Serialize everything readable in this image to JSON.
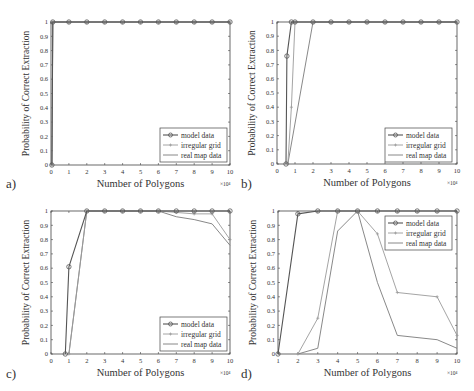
{
  "figure": {
    "y_label": "Probability of Correct Extraction",
    "x_label": "Number of Polygons",
    "x_exponent": "×10⁴",
    "legend": [
      "model data",
      "irregular grid",
      "real map data"
    ]
  },
  "colors": {
    "model": "#555555",
    "irregular": "#9a9a9a",
    "real": "#7a7a7a",
    "axis": "#444444"
  },
  "chart_data": [
    {
      "panel": "a)",
      "type": "line",
      "xlabel": "Number of Polygons",
      "ylabel": "Probability of Correct Extraction",
      "x_multiplier": "x10^4",
      "xlim": [
        0,
        10
      ],
      "ylim": [
        0,
        1
      ],
      "xticks": [
        0,
        1,
        2,
        3,
        4,
        5,
        6,
        7,
        8,
        9,
        10
      ],
      "yticks": [
        0,
        0.1,
        0.2,
        0.3,
        0.4,
        0.5,
        0.6,
        0.7,
        0.8,
        0.9,
        1
      ],
      "legend_position": "lower right",
      "series": [
        {
          "name": "model data",
          "marker": "o",
          "x": [
            0.05,
            0.1,
            1,
            2,
            3,
            4,
            5,
            6,
            7,
            8,
            9,
            10
          ],
          "y": [
            0,
            1,
            1,
            1,
            1,
            1,
            1,
            1,
            1,
            1,
            1,
            1
          ]
        },
        {
          "name": "irregular grid",
          "marker": "+",
          "x": [
            0.05,
            0.1,
            1,
            2,
            3,
            4,
            5,
            6,
            7,
            8,
            9,
            10
          ],
          "y": [
            0,
            1,
            1,
            1,
            1,
            1,
            1,
            1,
            1,
            1,
            1,
            1
          ]
        },
        {
          "name": "real map data",
          "marker": "",
          "x": [
            0.05,
            0.1,
            1,
            2,
            3,
            4,
            5,
            6,
            7,
            8,
            9,
            10
          ],
          "y": [
            0,
            1,
            1,
            1,
            1,
            1,
            1,
            1,
            1,
            1,
            1,
            1
          ]
        }
      ]
    },
    {
      "panel": "b)",
      "type": "line",
      "xlabel": "Number of Polygons",
      "ylabel": "Probability of Correct Extraction",
      "x_multiplier": "x10^4",
      "xlim": [
        0,
        10
      ],
      "ylim": [
        0,
        1
      ],
      "xticks": [
        0,
        1,
        2,
        3,
        4,
        5,
        6,
        7,
        8,
        9,
        10
      ],
      "yticks": [
        0,
        0.1,
        0.2,
        0.3,
        0.4,
        0.5,
        0.6,
        0.7,
        0.8,
        0.9,
        1
      ],
      "legend_position": "lower right",
      "series": [
        {
          "name": "model data",
          "marker": "o",
          "x": [
            0.5,
            0.55,
            0.8,
            1,
            2,
            3,
            4,
            5,
            6,
            7,
            8,
            9,
            10
          ],
          "y": [
            0,
            0.76,
            1,
            1,
            1,
            1,
            1,
            1,
            1,
            1,
            1,
            1,
            1
          ]
        },
        {
          "name": "irregular grid",
          "marker": "+",
          "x": [
            0.6,
            0.8,
            1,
            2,
            3,
            4,
            5,
            6,
            7,
            8,
            9,
            10
          ],
          "y": [
            0,
            0.4,
            1,
            1,
            1,
            1,
            1,
            1,
            1,
            1,
            1,
            1
          ]
        },
        {
          "name": "real map data",
          "marker": "",
          "x": [
            0.6,
            2,
            3,
            4,
            5,
            6,
            7,
            8,
            9,
            10
          ],
          "y": [
            0,
            1,
            1,
            1,
            1,
            1,
            1,
            1,
            1,
            1
          ]
        }
      ]
    },
    {
      "panel": "c)",
      "type": "line",
      "xlabel": "Number of Polygons",
      "ylabel": "Probability of Correct Extraction",
      "x_multiplier": "x10^4",
      "xlim": [
        0,
        10
      ],
      "ylim": [
        0,
        1
      ],
      "xticks": [
        0,
        1,
        2,
        3,
        4,
        5,
        6,
        7,
        8,
        9,
        10
      ],
      "yticks": [
        0,
        0.1,
        0.2,
        0.3,
        0.4,
        0.5,
        0.6,
        0.7,
        0.8,
        0.9,
        1
      ],
      "legend_position": "lower right",
      "series": [
        {
          "name": "model data",
          "marker": "o",
          "x": [
            0.8,
            1,
            2,
            3,
            4,
            5,
            6,
            7,
            8,
            9,
            10
          ],
          "y": [
            0,
            0.61,
            1,
            1,
            1,
            1,
            1,
            1,
            1,
            1,
            1
          ]
        },
        {
          "name": "irregular grid",
          "marker": "+",
          "x": [
            1,
            2,
            3,
            4,
            5,
            6,
            7,
            8,
            9,
            10
          ],
          "y": [
            0,
            1,
            1,
            1,
            1,
            1,
            0.99,
            0.98,
            0.98,
            0.8
          ]
        },
        {
          "name": "real map data",
          "marker": "",
          "x": [
            1,
            2,
            3,
            4,
            5,
            6,
            7,
            8,
            9,
            10
          ],
          "y": [
            0,
            1,
            1,
            1,
            1,
            1,
            0.96,
            0.94,
            0.91,
            0.76
          ]
        }
      ]
    },
    {
      "panel": "d)",
      "type": "line",
      "xlabel": "Number of Polygons",
      "ylabel": "Probability of Correct Extraction",
      "x_multiplier": "x10^4",
      "xlim": [
        1,
        10
      ],
      "ylim": [
        0,
        1
      ],
      "xticks": [
        1,
        2,
        3,
        4,
        5,
        6,
        7,
        8,
        9,
        10
      ],
      "yticks": [
        0,
        0.1,
        0.2,
        0.3,
        0.4,
        0.5,
        0.6,
        0.7,
        0.8,
        0.9,
        1
      ],
      "legend_position": "upper right",
      "series": [
        {
          "name": "model data",
          "marker": "o",
          "x": [
            1,
            2,
            3,
            4,
            5,
            6,
            7,
            8,
            9,
            10
          ],
          "y": [
            0,
            0.98,
            1,
            1,
            1,
            1,
            1,
            1,
            1,
            1
          ]
        },
        {
          "name": "irregular grid",
          "marker": "+",
          "x": [
            2,
            3,
            4,
            5,
            6,
            7,
            9,
            10
          ],
          "y": [
            0,
            0.25,
            1,
            1,
            0.84,
            0.43,
            0.4,
            0.13
          ]
        },
        {
          "name": "real map data",
          "marker": "",
          "x": [
            2,
            3,
            4,
            5,
            6,
            7,
            9,
            10
          ],
          "y": [
            0,
            0.04,
            0.86,
            1,
            0.5,
            0.13,
            0.1,
            0.04
          ]
        }
      ]
    }
  ],
  "panels_layout": [
    {
      "left": 51,
      "top": 22,
      "right": 230,
      "bottom": 165,
      "label_x": 6,
      "label_y": 188,
      "legend": {
        "x": 160,
        "y": 128
      }
    },
    {
      "left": 277,
      "top": 22,
      "right": 457,
      "bottom": 164,
      "label_x": 241,
      "label_y": 188,
      "legend": {
        "x": 385,
        "y": 128
      }
    },
    {
      "left": 51,
      "top": 211,
      "right": 230,
      "bottom": 354,
      "label_x": 6,
      "label_y": 378,
      "legend": {
        "x": 160,
        "y": 317
      }
    },
    {
      "left": 278,
      "top": 211,
      "right": 457,
      "bottom": 354,
      "label_x": 241,
      "label_y": 378,
      "legend": {
        "x": 385,
        "y": 216
      }
    }
  ]
}
